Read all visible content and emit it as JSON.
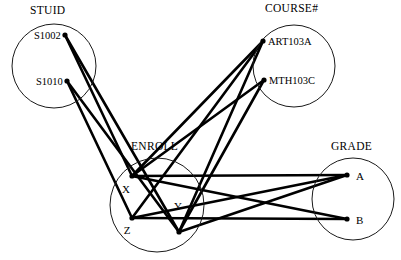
{
  "diagram": {
    "type": "network-data-model",
    "background_color": "#ffffff",
    "line_color": "#000000",
    "circle_stroke_color": "#1a1a1a",
    "sets": [
      {
        "id": "stuid",
        "title": "STUID",
        "title_x": 30,
        "title_y": 14,
        "cx": 54,
        "cy": 66,
        "r": 42,
        "nodes": [
          {
            "id": "s1002",
            "label": "S1002",
            "x": 65,
            "y": 35,
            "label_x": 34,
            "label_y": 39,
            "anchor": "start"
          },
          {
            "id": "s1010",
            "label": "S1010",
            "x": 67,
            "y": 81,
            "label_x": 36,
            "label_y": 85,
            "anchor": "start"
          }
        ]
      },
      {
        "id": "course",
        "title": "COURSE#",
        "title_x": 265,
        "title_y": 12,
        "cx": 294,
        "cy": 66,
        "r": 41,
        "nodes": [
          {
            "id": "art103a",
            "label": "ART103A",
            "x": 263,
            "y": 41,
            "label_x": 268,
            "label_y": 45,
            "anchor": "start"
          },
          {
            "id": "mth103c",
            "label": "MTH103C",
            "x": 264,
            "y": 80,
            "label_x": 269,
            "label_y": 84,
            "anchor": "start"
          }
        ]
      },
      {
        "id": "enroll",
        "title": "ENROLL",
        "title_x": 131,
        "title_y": 150,
        "cx": 157,
        "cy": 205,
        "r": 47,
        "nodes": [
          {
            "id": "x",
            "label": "X",
            "x": 132,
            "y": 176,
            "label_x": 126,
            "label_y": 193,
            "anchor": "middle"
          },
          {
            "id": "y",
            "label": "Y",
            "x": 179,
            "y": 232,
            "label_x": 178,
            "label_y": 210,
            "anchor": "middle"
          },
          {
            "id": "z",
            "label": "Z",
            "x": 132,
            "y": 218,
            "label_x": 127,
            "label_y": 234,
            "anchor": "middle"
          }
        ]
      },
      {
        "id": "grade",
        "title": "GRADE",
        "title_x": 331,
        "title_y": 150,
        "cx": 353,
        "cy": 199,
        "r": 41,
        "nodes": [
          {
            "id": "a",
            "label": "A",
            "x": 347,
            "y": 175,
            "label_x": 356,
            "label_y": 180,
            "anchor": "start"
          },
          {
            "id": "b",
            "label": "B",
            "x": 347,
            "y": 219,
            "label_x": 356,
            "label_y": 224,
            "anchor": "start"
          }
        ]
      }
    ],
    "edges": [
      {
        "id": "s1002-x",
        "from": "s1002",
        "to": "x",
        "x1": 65,
        "y1": 35,
        "x2": 132,
        "y2": 176
      },
      {
        "id": "s1002-y",
        "from": "s1002",
        "to": "y",
        "x1": 65,
        "y1": 35,
        "x2": 179,
        "y2": 232
      },
      {
        "id": "s1010-z",
        "from": "s1010",
        "to": "z",
        "x1": 67,
        "y1": 81,
        "x2": 132,
        "y2": 218
      },
      {
        "id": "s1010-y",
        "from": "s1010",
        "to": "y",
        "x1": 67,
        "y1": 81,
        "x2": 179,
        "y2": 232
      },
      {
        "id": "x-art103a",
        "from": "x",
        "to": "art103a",
        "x1": 132,
        "y1": 176,
        "x2": 263,
        "y2": 41
      },
      {
        "id": "z-art103a",
        "from": "z",
        "to": "art103a",
        "x1": 132,
        "y1": 218,
        "x2": 263,
        "y2": 41
      },
      {
        "id": "y-art103a",
        "from": "y",
        "to": "art103a",
        "x1": 179,
        "y1": 232,
        "x2": 263,
        "y2": 41
      },
      {
        "id": "y-mth103c",
        "from": "y",
        "to": "mth103c",
        "x1": 179,
        "y1": 232,
        "x2": 264,
        "y2": 80
      },
      {
        "id": "x-mth103c",
        "from": "x",
        "to": "mth103c",
        "x1": 132,
        "y1": 176,
        "x2": 264,
        "y2": 80
      },
      {
        "id": "x-a",
        "from": "x",
        "to": "a",
        "x1": 132,
        "y1": 176,
        "x2": 347,
        "y2": 175
      },
      {
        "id": "z-a",
        "from": "z",
        "to": "a",
        "x1": 132,
        "y1": 218,
        "x2": 347,
        "y2": 175
      },
      {
        "id": "y-a",
        "from": "y",
        "to": "a",
        "x1": 179,
        "y1": 232,
        "x2": 347,
        "y2": 175
      },
      {
        "id": "z-b",
        "from": "z",
        "to": "b",
        "x1": 132,
        "y1": 218,
        "x2": 347,
        "y2": 219
      },
      {
        "id": "x-b",
        "from": "x",
        "to": "b",
        "x1": 132,
        "y1": 176,
        "x2": 347,
        "y2": 219
      }
    ]
  }
}
